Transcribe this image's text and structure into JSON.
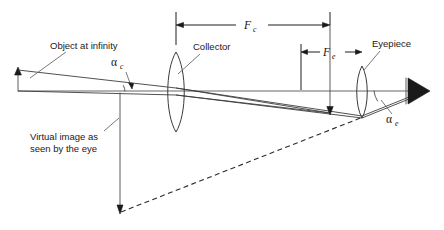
{
  "figure": {
    "background_color": "#ffffff",
    "line_color": "#3a3a3a",
    "text_color": "#1a1a1a"
  },
  "labels": {
    "object_at_infinity": "Object at infinity",
    "collector": "Collector",
    "eyepiece": "Eyepiece",
    "virtual_image_line1": "Virtual image as",
    "virtual_image_line2": "seen by the eye",
    "alpha": "α",
    "alpha_c_sub": "c",
    "alpha_e_sub": "e",
    "f_symbol": "F",
    "fc_sub": "c",
    "fe_sub": "e"
  },
  "dimensions": [
    {
      "name": "collector-focal-length",
      "symbol": "F",
      "subscript": "c",
      "from_x": 176,
      "to_x": 330,
      "y": 25
    },
    {
      "name": "eyepiece-focal-length",
      "symbol": "F",
      "subscript": "e",
      "from_x": 301,
      "to_x": 362,
      "y": 52
    }
  ],
  "angles": [
    {
      "name": "alpha-c",
      "symbol": "α",
      "subscript": "c",
      "label_x": 117,
      "label_y": 62,
      "description": "collector side field angle"
    },
    {
      "name": "alpha-e",
      "symbol": "α",
      "subscript": "e",
      "label_x": 390,
      "label_y": 121,
      "description": "eyepiece side apparent field angle"
    }
  ],
  "elements": {
    "collector_lens": {
      "center_x": 176,
      "center_y": 92,
      "half_height": 40,
      "bulge": 11
    },
    "eyepiece_lens": {
      "center_x": 362,
      "center_y": 92,
      "half_height": 26,
      "bulge": 7
    },
    "object_arrow": {
      "x": 18,
      "top_y": 68,
      "bottom_y": 91
    },
    "virtual_image_arrow": {
      "x": 120,
      "top_y": 93,
      "bottom_y": 213
    },
    "focal_plane_arrow": {
      "x": 330,
      "top_y": 15,
      "bottom_y": 115
    },
    "eye_symbol": {
      "tip_x": 428,
      "base_x": 408,
      "center_y": 91,
      "half_height": 13
    },
    "optical_axis": {
      "from_x": 18,
      "to_x": 418,
      "y": 91
    }
  }
}
